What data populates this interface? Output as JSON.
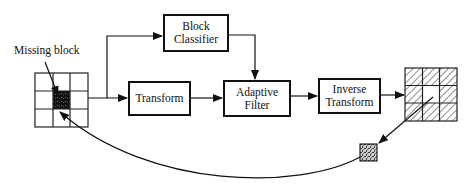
{
  "diagram": {
    "labels": {
      "missing_block": "Missing block"
    },
    "blocks": {
      "block_classifier": {
        "line1": "Block",
        "line2": "Classifier"
      },
      "transform": {
        "line1": "Transform"
      },
      "adaptive_filter": {
        "line1": "Adaptive",
        "line2": "Filter"
      },
      "inverse_transform": {
        "line1": "Inverse",
        "line2": "Transform"
      }
    },
    "grids": {
      "input_grid": {
        "rows": 3,
        "cols": 3,
        "missing_cell": [
          1,
          1
        ],
        "pattern": "plain"
      },
      "output_grid": {
        "rows": 3,
        "cols": 3,
        "pattern": "hatched"
      }
    },
    "flow": [
      "input_grid -> transform",
      "input_grid -> block_classifier",
      "block_classifier -> adaptive_filter",
      "transform -> adaptive_filter",
      "adaptive_filter -> inverse_transform",
      "inverse_transform -> output_grid",
      "output_grid -> recovered_block",
      "recovered_block -> input_grid (missing cell)"
    ]
  }
}
